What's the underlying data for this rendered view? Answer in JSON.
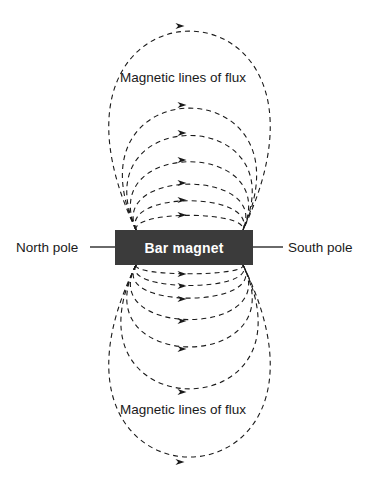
{
  "diagram": {
    "background_color": "#ffffff",
    "magnet": {
      "label": "Bar magnet",
      "fill_color": "#3b3b3b",
      "text_color": "#ffffff",
      "x": 115,
      "y": 230,
      "width": 138,
      "height": 35
    },
    "labels": {
      "north_pole": "North pole",
      "south_pole": "South pole",
      "flux_top": "Magnetic lines of flux",
      "flux_bottom": "Magnetic lines of flux"
    },
    "leader_lines": [
      {
        "name": "north-pole-leader",
        "x1": 90,
        "y1": 247,
        "x2": 115,
        "y2": 247
      },
      {
        "name": "south-pole-leader",
        "x1": 253,
        "y1": 247,
        "x2": 283,
        "y2": 247
      }
    ],
    "field_lines": {
      "style": "dashed",
      "color": "#1a1a1a",
      "dash_pattern": "5,4",
      "stroke_width": 1.1,
      "arrow_direction": "right",
      "pole_exit_left_x": 136,
      "pole_entry_right_x": 243,
      "magnet_top_y": 230,
      "magnet_bottom_y": 265,
      "upper_arcs": [
        {
          "index": 1,
          "apex_y": 215,
          "arrow_x": 182,
          "arrow_y": 215,
          "spread": 4
        },
        {
          "index": 2,
          "apex_y": 200,
          "arrow_x": 182,
          "arrow_y": 200,
          "spread": 14
        },
        {
          "index": 3,
          "apex_y": 183,
          "arrow_x": 182,
          "arrow_y": 183,
          "spread": 26
        },
        {
          "index": 4,
          "apex_y": 160,
          "arrow_x": 182,
          "arrow_y": 160,
          "spread": 40
        },
        {
          "index": 5,
          "apex_y": 133,
          "arrow_x": 182,
          "arrow_y": 133,
          "spread": 56
        },
        {
          "index": 6,
          "apex_y": 105,
          "arrow_x": 182,
          "arrow_y": 105,
          "spread": 74
        },
        {
          "index": 7,
          "apex_y": 26,
          "arrow_x": 180,
          "arrow_y": 26,
          "spread": 126
        }
      ],
      "lower_arcs": [
        {
          "index": 1,
          "apex_y": 274,
          "arrow_x": 182,
          "arrow_y": 274,
          "spread": 4
        },
        {
          "index": 2,
          "apex_y": 286,
          "arrow_x": 182,
          "arrow_y": 286,
          "spread": 14
        },
        {
          "index": 3,
          "apex_y": 299,
          "arrow_x": 182,
          "arrow_y": 299,
          "spread": 26
        },
        {
          "index": 4,
          "apex_y": 321,
          "arrow_x": 182,
          "arrow_y": 321,
          "spread": 40
        },
        {
          "index": 5,
          "apex_y": 349,
          "arrow_x": 182,
          "arrow_y": 349,
          "spread": 56
        },
        {
          "index": 6,
          "apex_y": 392,
          "arrow_x": 182,
          "arrow_y": 392,
          "spread": 80
        },
        {
          "index": 7,
          "apex_y": 462,
          "arrow_x": 180,
          "arrow_y": 462,
          "spread": 126
        }
      ],
      "arrow_count_total": 14
    }
  }
}
